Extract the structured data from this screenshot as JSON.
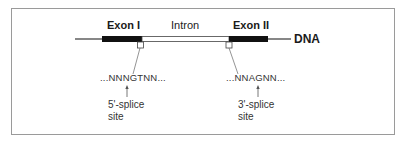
{
  "diagram": {
    "type": "gene-structure",
    "segments": [
      {
        "name": "Exon I",
        "kind": "exon",
        "color": "#111111"
      },
      {
        "name": "Intron",
        "kind": "intron",
        "color": "#ffffff"
      },
      {
        "name": "Exon II",
        "kind": "exon",
        "color": "#111111"
      }
    ],
    "strand_label": "DNA",
    "splice_sites": [
      {
        "sequence": "...NNNGTNN...",
        "label_line1": "5'-splice",
        "label_line2": "site"
      },
      {
        "sequence": "...NNAGNN...",
        "label_line1": "3'-splice",
        "label_line2": "site"
      }
    ]
  }
}
